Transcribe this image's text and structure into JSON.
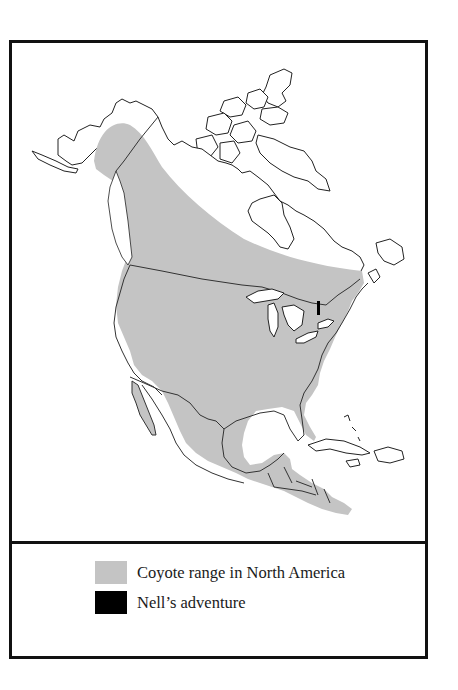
{
  "map": {
    "title": "Coyote range map of North America",
    "colors": {
      "coyote_range": "#c4c4c4",
      "nells_adventure": "#000000",
      "land_outline": "#222222",
      "background": "#ffffff"
    },
    "regions_shown": [
      "Alaska",
      "Canada",
      "Canadian Arctic Archipelago",
      "United States",
      "Mexico",
      "Central America",
      "Caribbean islands"
    ]
  },
  "legend": {
    "items": [
      {
        "label": "Coyote range in North America",
        "swatch_color": "#c4c4c4",
        "icon": "gray-swatch"
      },
      {
        "label": "Nell’s adventure",
        "swatch_color": "#000000",
        "icon": "black-swatch"
      }
    ]
  }
}
